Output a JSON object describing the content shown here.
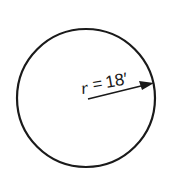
{
  "diagram": {
    "shape": "circle",
    "radius_label": {
      "variable": "r",
      "equals": "=",
      "value": "18′"
    },
    "colors": {
      "stroke": "#1a1a1a",
      "background": "#ffffff"
    }
  }
}
